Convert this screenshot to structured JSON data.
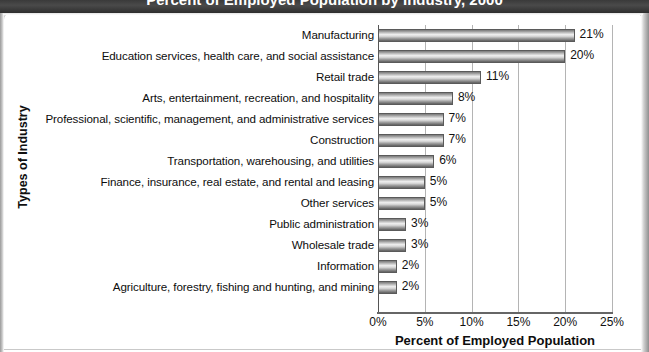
{
  "header": {
    "title": "Percent of Employed Population by Industry, 2000"
  },
  "chart_data": {
    "type": "bar",
    "orientation": "horizontal",
    "title": "Percent of Employed Population by Industry, 2000",
    "xlabel": "Percent of Employed Population",
    "ylabel": "Types of Industry",
    "xlim": [
      0,
      25
    ],
    "xtick_labels": [
      "0%",
      "5%",
      "10%",
      "15%",
      "20%",
      "25%"
    ],
    "xticks": [
      0,
      5,
      10,
      15,
      20,
      25
    ],
    "grid": true,
    "legend": "none",
    "categories": [
      "Manufacturing",
      "Education services, health care, and social assistance",
      "Retail trade",
      "Arts, entertainment, recreation, and hospitality",
      "Professional, scientific, management, and administrative services",
      "Construction",
      "Transportation, warehousing, and utilities",
      "Finance, insurance, real estate, and rental and leasing",
      "Other services",
      "Public administration",
      "Wholesale trade",
      "Information",
      "Agriculture, forestry, fishing and hunting, and mining"
    ],
    "values": [
      21,
      20,
      11,
      8,
      7,
      7,
      6,
      5,
      5,
      3,
      3,
      2,
      2
    ],
    "value_labels": [
      "21%",
      "20%",
      "11%",
      "8%",
      "7%",
      "7%",
      "6%",
      "5%",
      "5%",
      "3%",
      "3%",
      "2%",
      "2%"
    ],
    "bar_color": "#b0b0b0",
    "bar_edge_color": "#5a5a5a",
    "grid_color": "#b4b4b4"
  }
}
